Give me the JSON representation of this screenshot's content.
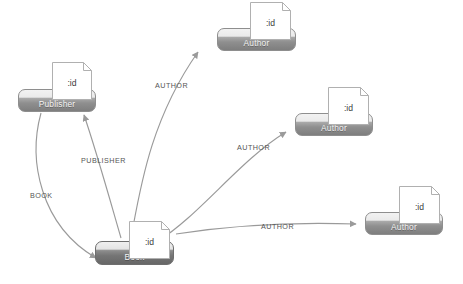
{
  "diagram": {
    "colors": {
      "node_border": "#8e8e8e",
      "node_fill_top": "#f2f2f2",
      "node_fill_bottom": "#7e7e7e",
      "node_dark_fill_bottom": "#676767",
      "node_label_text": "#f4f4f4",
      "edge_stroke": "#9a9a9a",
      "edge_label_text": "#555555",
      "doc_border": "#b0b0b0",
      "doc_fill": "#ffffff",
      "doc_text": "#3b3b3b",
      "background": "#ffffff"
    },
    "nodes": [
      {
        "id": "publisher",
        "label": "Publisher",
        "doc_label": ":id",
        "doc_icon": "document-icon",
        "style": "light",
        "x": 18,
        "y": 89,
        "w": 78,
        "h": 23,
        "doc_x": 52,
        "doc_y": 62,
        "doc_w": 40,
        "doc_h": 38
      },
      {
        "id": "author-top",
        "label": "Author",
        "doc_label": ":id",
        "doc_icon": "document-icon",
        "style": "light",
        "x": 217,
        "y": 28,
        "w": 79,
        "h": 23,
        "doc_x": 250,
        "doc_y": 2,
        "doc_w": 41,
        "doc_h": 38
      },
      {
        "id": "author-middle",
        "label": "Author",
        "doc_label": ":id",
        "doc_icon": "document-icon",
        "style": "light",
        "x": 295,
        "y": 113,
        "w": 78,
        "h": 23,
        "doc_x": 328,
        "doc_y": 87,
        "doc_w": 41,
        "doc_h": 38
      },
      {
        "id": "author-bottom",
        "label": "Author",
        "doc_label": ":id",
        "doc_icon": "document-icon",
        "style": "light",
        "x": 365,
        "y": 212,
        "w": 78,
        "h": 23,
        "doc_x": 399,
        "doc_y": 186,
        "doc_w": 41,
        "doc_h": 38
      },
      {
        "id": "book",
        "label": "Book",
        "doc_label": ":id",
        "doc_icon": "document-icon",
        "style": "dark",
        "x": 95,
        "y": 241,
        "w": 79,
        "h": 24,
        "doc_x": 129,
        "doc_y": 221,
        "doc_w": 41,
        "doc_h": 38
      }
    ],
    "edges": [
      {
        "id": "edge-book-author-top",
        "label": "AUTHOR",
        "from": "book",
        "to": "author-top",
        "path": "M 131 238 C 140 190, 150 120, 198 52",
        "label_x": 155,
        "label_y": 81
      },
      {
        "id": "edge-book-author-middle",
        "label": "AUTHOR",
        "from": "book",
        "to": "author-middle",
        "path": "M 158 241 C 200 215, 240 160, 286 132",
        "label_x": 237,
        "label_y": 143
      },
      {
        "id": "edge-book-author-bottom",
        "label": "AUTHOR",
        "from": "book",
        "to": "author-bottom",
        "path": "M 176 234 C 240 224, 300 222, 356 224",
        "label_x": 261,
        "label_y": 222
      },
      {
        "id": "edge-book-publisher",
        "label": "PUBLISHER",
        "from": "book",
        "to": "publisher",
        "path": "M 121 238 C 110 200, 96 150, 84 115",
        "label_x": 81,
        "label_y": 156
      },
      {
        "id": "edge-publisher-book",
        "label": "BOOK",
        "from": "publisher",
        "to": "book",
        "path": "M 41 113 C 28 160, 40 225, 96 258",
        "label_x": 30,
        "label_y": 191
      }
    ]
  }
}
